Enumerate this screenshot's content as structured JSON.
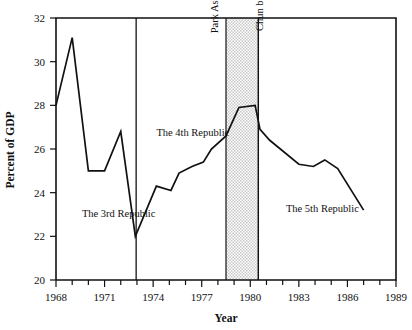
{
  "chart_data": {
    "type": "line",
    "title": "",
    "xlabel": "Year",
    "ylabel": "Percent of GDP",
    "xlim": [
      1968,
      1989
    ],
    "ylim": [
      20,
      32
    ],
    "grid": false,
    "legend": "none",
    "x_ticks_major": [
      1968,
      1971,
      1974,
      1977,
      1980,
      1983,
      1986,
      1989
    ],
    "x_ticks_minor": [
      1969,
      1970,
      1972,
      1973,
      1975,
      1976,
      1978,
      1979,
      1981,
      1982,
      1984,
      1985,
      1987,
      1988
    ],
    "x_tick_labels": [
      "1968",
      "1971",
      "1974",
      "1977",
      "1980",
      "1983",
      "1986",
      "1989"
    ],
    "y_ticks": [
      20,
      22,
      24,
      26,
      28,
      30,
      32
    ],
    "y_tick_labels": [
      "20",
      "22",
      "24",
      "26",
      "28",
      "30",
      "32"
    ],
    "series": [
      {
        "name": "Percent of GDP",
        "color": "#111111",
        "x": [
          1968,
          1969,
          1970,
          1971,
          1972,
          1972.9,
          1974.2,
          1975.1,
          1975.6,
          1976.4,
          1977.1,
          1977.6,
          1978.5,
          1979.3,
          1980.3,
          1980.6,
          1981.2,
          1983.0,
          1983.9,
          1984.6,
          1985.4,
          1987.0
        ],
        "values": [
          28.0,
          31.1,
          25.0,
          25.0,
          26.8,
          22.0,
          24.3,
          24.1,
          24.9,
          25.2,
          25.4,
          26.0,
          26.6,
          27.9,
          28.0,
          26.9,
          26.4,
          25.3,
          25.2,
          25.5,
          25.1,
          23.2
        ]
      }
    ],
    "annotations": [
      {
        "name": "era-3rd-republic",
        "text": "The 3rd Republic",
        "x": 1969.6,
        "y": 22.9,
        "orientation": "horizontal"
      },
      {
        "name": "era-4th-republic",
        "text": "The 4th Republic",
        "x": 1974.2,
        "y": 26.6,
        "orientation": "horizontal"
      },
      {
        "name": "era-5th-republic",
        "text": "The 5th Republic",
        "x": 1982.2,
        "y": 23.1,
        "orientation": "horizontal"
      },
      {
        "name": "event-park-assassinated",
        "text": "Park Assassinated",
        "x": 1978.0,
        "y": 31.3,
        "orientation": "vertical"
      },
      {
        "name": "event-chun-became-president",
        "text": "Chun became President",
        "x": 1980.8,
        "y": 31.4,
        "orientation": "vertical"
      }
    ],
    "vertical_dividers": [
      {
        "name": "divider-3rd-to-4th-republic",
        "x": 1972.95
      },
      {
        "name": "divider-chun-became-president",
        "x": 1980.5
      }
    ],
    "shaded_band": {
      "name": "transition-period-band",
      "x_start": 1978.5,
      "x_end": 1980.5,
      "fill": "#d9d9d9"
    }
  },
  "colors": {
    "line": "#111111",
    "axis": "#111111",
    "band": "#d9d9d9",
    "background": "#ffffff"
  }
}
